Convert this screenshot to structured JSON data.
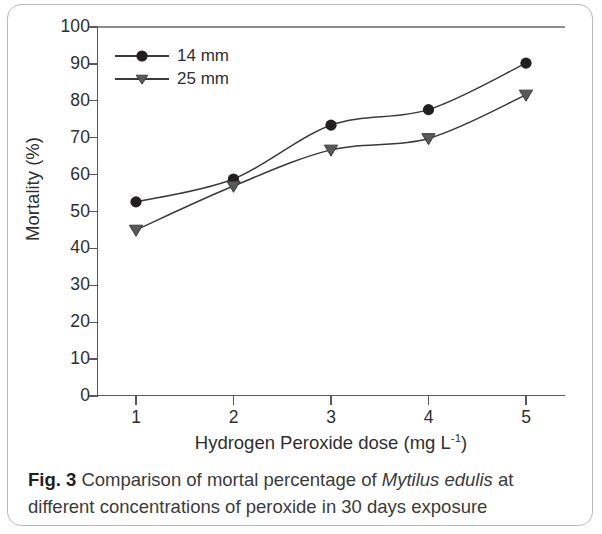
{
  "figure": {
    "caption_label": "Fig. 3",
    "caption_part1": " Comparison of mortal percentage of ",
    "caption_species": "Mytilus edulis",
    "caption_part2": " at different concentrations of peroxide in 30 days exposure"
  },
  "chart_data": {
    "type": "line",
    "title": "",
    "xlabel_text": "Hydrogen Peroxide dose (mg L",
    "xlabel_sup": "-1",
    "xlabel_tail": ")",
    "xlabel": "Hydrogen Peroxide dose (mg L-1)",
    "ylabel": "Mortality (%)",
    "x": [
      1,
      2,
      3,
      4,
      5
    ],
    "xticklabels": [
      "1",
      "2",
      "3",
      "4",
      "5"
    ],
    "yticks": [
      0,
      10,
      20,
      30,
      40,
      50,
      60,
      70,
      80,
      90,
      100
    ],
    "yticklabels": [
      "0",
      "10",
      "20",
      "30",
      "40",
      "50",
      "60",
      "70",
      "80",
      "90",
      "100"
    ],
    "xlim": [
      0.6,
      5.4
    ],
    "ylim": [
      0,
      100
    ],
    "grid": false,
    "legend_position": "upper left",
    "series": [
      {
        "name": "14 mm",
        "marker": "circle",
        "color": "#231f20",
        "values": [
          52.6,
          58.8,
          73.4,
          77.6,
          90.2
        ]
      },
      {
        "name": "25 mm",
        "marker": "triangle-down",
        "color": "#58595b",
        "values": [
          45.0,
          56.9,
          66.7,
          69.8,
          81.6
        ]
      }
    ]
  }
}
